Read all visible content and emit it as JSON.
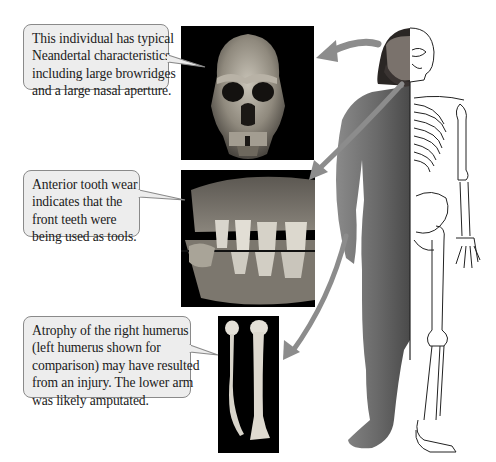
{
  "figure": {
    "callouts": [
      {
        "id": "skull",
        "lines": [
          "This individual has typical",
          "Neandertal characteristics,",
          "including large browridges",
          "and a large nasal aperture."
        ]
      },
      {
        "id": "teeth",
        "lines": [
          "Anterior tooth wear",
          "indicates that the",
          "front teeth were",
          "being used as tools."
        ]
      },
      {
        "id": "humerus",
        "lines": [
          "Atrophy of the right humerus",
          "(left humerus shown for",
          "comparison) may have resulted",
          "from an injury. The lower arm",
          "was likely amputated."
        ]
      }
    ],
    "images": [
      {
        "id": "skull-photo",
        "depicts": "Neandertal skull, frontal view"
      },
      {
        "id": "teeth-photo",
        "depicts": "Worn anterior teeth, close-up"
      },
      {
        "id": "humerus-photo",
        "depicts": "Atrophied right humerus beside normal left humerus"
      },
      {
        "id": "body-illustration",
        "depicts": "Half-fleshed Neandertal man / half skeleton"
      }
    ],
    "colors": {
      "callout_fill": "#ededed",
      "callout_border": "#8a8a8a",
      "arrow": "#8c8c8c",
      "photo_bg": "#000000",
      "skin": "#6e6e6e"
    }
  }
}
